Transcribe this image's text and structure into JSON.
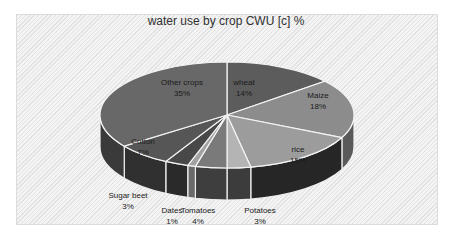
{
  "chart_data": {
    "type": "pie",
    "title": "water use by crop CWU [c] %",
    "style": "3d-pie",
    "start_angle_deg": 0,
    "direction": "clockwise",
    "categories": [
      "wheat",
      "Maize",
      "rice",
      "Potatoes",
      "Tomatoes",
      "Dates",
      "Sugar beet",
      "Cotton",
      "Other crops"
    ],
    "values": [
      14,
      18,
      15,
      3,
      4,
      1,
      3,
      7,
      35
    ],
    "labels": [
      "14%",
      "18%",
      "15%",
      "3%",
      "4%",
      "1%",
      "3%",
      "7%",
      "35%"
    ],
    "colors": [
      "#5c5c5c",
      "#8c8c8c",
      "#9c9c9c",
      "#b4b4b4",
      "#7a7a7a",
      "#a2a2a2",
      "#484848",
      "#565656",
      "#686868"
    ],
    "side_colors": [
      "#3a3a3a",
      "#5a5a5a",
      "#262626",
      "#3c3c3c",
      "#3e3e3e",
      "#6a6a6a",
      "#2a2a2a",
      "#303030",
      "#3a3a3a"
    ],
    "label_positions": [
      {
        "x": 244,
        "y": 85
      },
      {
        "x": 318,
        "y": 98
      },
      {
        "x": 298,
        "y": 152
      },
      {
        "x": 260,
        "y": 213
      },
      {
        "x": 198,
        "y": 213
      },
      {
        "x": 172,
        "y": 213
      },
      {
        "x": 128,
        "y": 198
      },
      {
        "x": 143,
        "y": 144
      },
      {
        "x": 182,
        "y": 85
      }
    ],
    "legend": "none"
  }
}
